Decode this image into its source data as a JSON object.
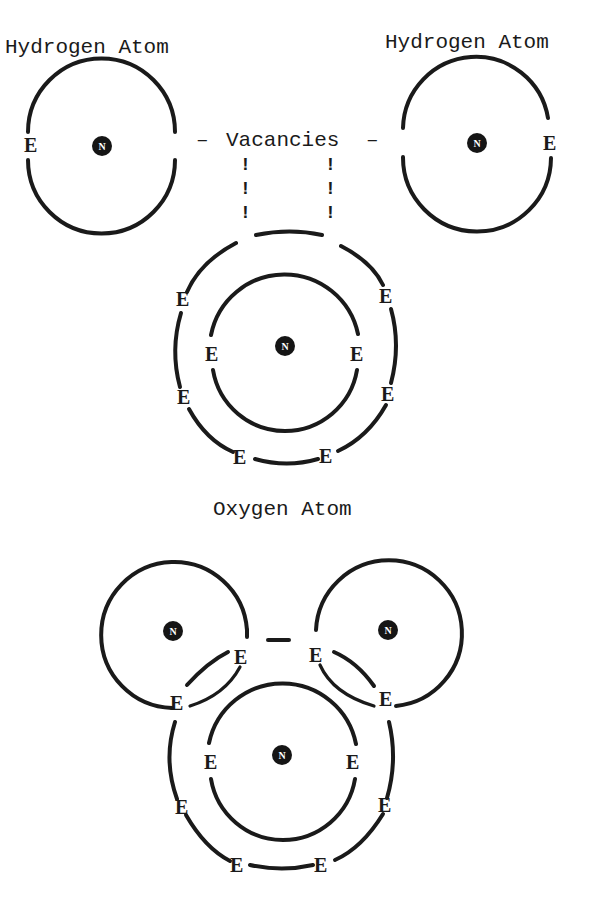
{
  "figure": {
    "top": {
      "left_atom": {
        "label": "Hydrogen Atom",
        "electron": "E",
        "nucleus": "N"
      },
      "right_atom": {
        "label": "Hydrogen Atom",
        "electron": "E",
        "nucleus": "N"
      },
      "vacancies_label": "Vacancies",
      "vacancy_left_dash": "–",
      "vacancy_right_dash": "–",
      "vacancy_marker": "!",
      "oxygen_atom": {
        "label": "Oxygen Atom",
        "nucleus": "N",
        "inner_shell_electrons": [
          "E",
          "E"
        ],
        "outer_shell_electrons": [
          "E",
          "E",
          "E",
          "E",
          "E",
          "E"
        ]
      }
    },
    "bottom": {
      "molecule": {
        "hydrogen_left": {
          "nucleus": "N"
        },
        "hydrogen_right": {
          "nucleus": "N"
        },
        "oxygen": {
          "nucleus": "N"
        },
        "shared_electrons": [
          "E",
          "E",
          "E",
          "E"
        ],
        "inner_shell_electrons": [
          "E",
          "E"
        ],
        "outer_shell_electrons": [
          "E",
          "E",
          "E",
          "E"
        ]
      }
    },
    "colors": {
      "ink": "#1a1a1a",
      "background": "#ffffff"
    }
  }
}
